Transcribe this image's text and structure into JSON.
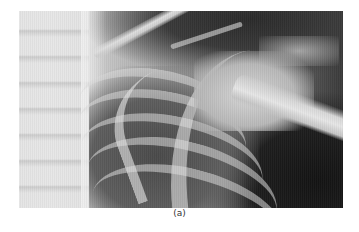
{
  "figure": {
    "type": "radiograph",
    "caption": "(a)"
  }
}
